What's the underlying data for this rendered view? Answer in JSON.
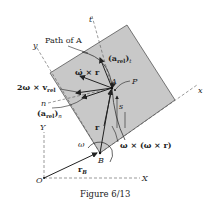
{
  "figure": {
    "caption": "Figure 6/13",
    "colors": {
      "plate": "#c8c8c8",
      "ink": "#222222",
      "background": "#ffffff"
    },
    "labels": {
      "path_of_A": "Path of A",
      "t_axis": "t",
      "y_axis": "y",
      "x_axis": "x",
      "a_rel_t": "(aₐₑₗ)ₜ",
      "a_rel_t_main": "(a",
      "a_rel_t_sub": "rel",
      "a_rel_t_close": ")",
      "a_rel_t_idx": "t",
      "omega_dot_cross_r": "ω̇ × r",
      "point_A": "A",
      "point_P": "P",
      "two_omega_v_rel": "2ω × v",
      "two_omega_v_rel_sub": "rel",
      "n_axis": "n",
      "a_rel_n_main": "(a",
      "a_rel_n_sub": "rel",
      "a_rel_n_close": ")",
      "a_rel_n_idx": "n",
      "s": "s",
      "r": "r",
      "omega": "ω",
      "point_B": "B",
      "omega_cross_omega_cross_r": "ω × (ω × r)",
      "Y_axis": "Y",
      "r_B": "r",
      "r_B_sub": "B",
      "origin_O": "O",
      "X_axis": "X"
    }
  }
}
